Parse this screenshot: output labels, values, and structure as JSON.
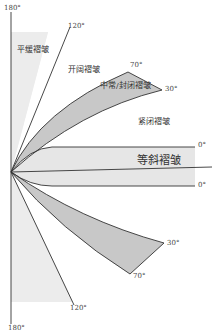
{
  "diagram": {
    "type": "fold-classification-by-interlimb-angle",
    "colors": {
      "gentle_fill": "#ececec",
      "moderate_fill": "#c8c8c8",
      "isoclinal_fill": "#e6e6e6",
      "line": "#333333"
    },
    "angle_labels": {
      "top_180": "180°",
      "top_120": "120°",
      "top_70": "70°",
      "top_30": "30°",
      "top_0": "0°",
      "bottom_0": "0°",
      "bottom_30": "30°",
      "bottom_70": "70°",
      "bottom_120": "120°",
      "bottom_180": "180°"
    },
    "fold_labels": {
      "gentle": "平缓褶皱",
      "open": "开阔褶皱",
      "moderate_close": "中常/封闭褶皱",
      "tight": "紧闭褶皱",
      "isoclinal": "等斜褶皱"
    }
  }
}
